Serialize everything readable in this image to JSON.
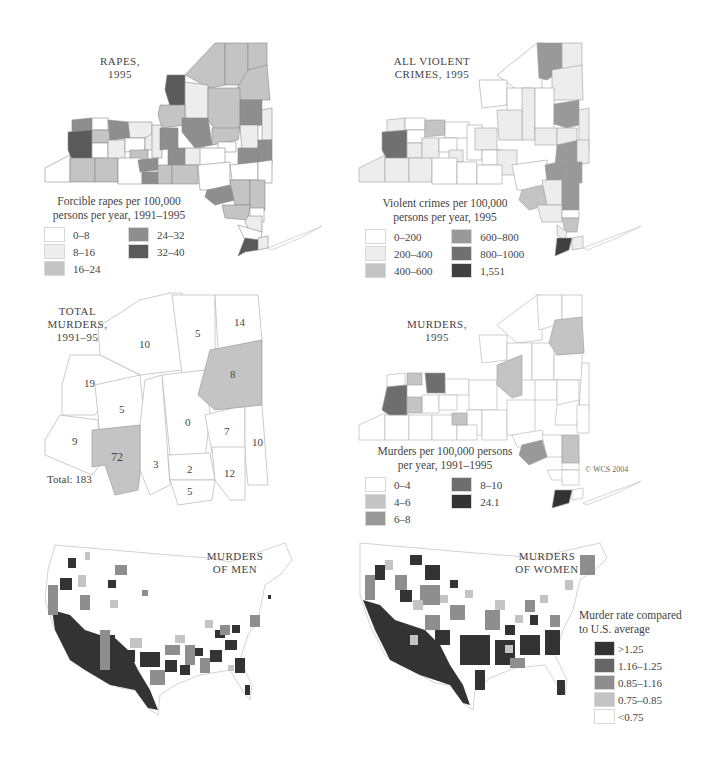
{
  "colors": {
    "c1": "#ffffff",
    "c2": "#ededed",
    "c3": "#c4c4c4",
    "c4": "#8e8e8e",
    "c5": "#656565",
    "c6": "#333333",
    "border": "#9a9a9a",
    "background": "#ffffff"
  },
  "panels": {
    "rapes": {
      "title": "RAPES,\n1995",
      "legend_title": "Forcible rapes per 100,000\npersons per year, 1991–1995",
      "legend": [
        {
          "label": "0–8",
          "color": "#ffffff"
        },
        {
          "label": "8–16",
          "color": "#ededed"
        },
        {
          "label": "16–24",
          "color": "#c4c4c4"
        },
        {
          "label": "24–32",
          "color": "#8e8e8e"
        },
        {
          "label": "32–40",
          "color": "#5a5a5a"
        }
      ]
    },
    "violent": {
      "title": "ALL VIOLENT\nCRIMES, 1995",
      "legend_title": "Violent crimes per 100,000\npersons per year, 1995",
      "legend": [
        {
          "label": "0–200",
          "color": "#ffffff"
        },
        {
          "label": "200–400",
          "color": "#ededed"
        },
        {
          "label": "400–600",
          "color": "#c4c4c4"
        },
        {
          "label": "600–800",
          "color": "#999999"
        },
        {
          "label": "800–1000",
          "color": "#707070"
        },
        {
          "label": "1,551",
          "color": "#404040"
        }
      ]
    },
    "total_murders": {
      "title": "TOTAL\nMURDERS,\n1991–95",
      "total_label": "Total: 183",
      "counties": [
        {
          "value": "10",
          "highlight": false
        },
        {
          "value": "5",
          "highlight": false
        },
        {
          "value": "14",
          "highlight": false
        },
        {
          "value": "19",
          "highlight": false
        },
        {
          "value": "8",
          "highlight": true
        },
        {
          "value": "5",
          "highlight": false
        },
        {
          "value": "0",
          "highlight": false
        },
        {
          "value": "9",
          "highlight": false
        },
        {
          "value": "72",
          "highlight": true
        },
        {
          "value": "7",
          "highlight": false
        },
        {
          "value": "10",
          "highlight": false
        },
        {
          "value": "3",
          "highlight": false
        },
        {
          "value": "2",
          "highlight": false
        },
        {
          "value": "12",
          "highlight": false
        },
        {
          "value": "5",
          "highlight": false
        }
      ]
    },
    "murders": {
      "title": "MURDERS,\n1995",
      "legend_title": "Murders per 100,000 persons\nper year, 1991–1995",
      "legend": [
        {
          "label": "0–4",
          "color": "#ffffff"
        },
        {
          "label": "4–6",
          "color": "#c4c4c4"
        },
        {
          "label": "6–8",
          "color": "#999999"
        },
        {
          "label": "8–10",
          "color": "#6e6e6e"
        },
        {
          "label": "24.1",
          "color": "#333333"
        }
      ],
      "copyright": "© WCS 2004"
    },
    "men": {
      "title": "MURDERS\nOF MEN"
    },
    "women": {
      "title": "MURDERS\nOF WOMEN",
      "legend_title": "Murder rate compared\nto U.S. average",
      "legend": [
        {
          "label": ">1.25",
          "color": "#333333"
        },
        {
          "label": "1.16–1.25",
          "color": "#666666"
        },
        {
          "label": "0.85–1.16",
          "color": "#8e8e8e"
        },
        {
          "label": "0.75–0.85",
          "color": "#c4c4c4"
        },
        {
          "label": "<0.75",
          "color": "#ffffff"
        }
      ]
    }
  }
}
